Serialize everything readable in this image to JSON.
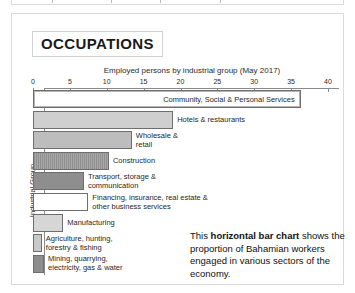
{
  "panel": {
    "title": "OCCUPATIONS"
  },
  "chart_data": {
    "type": "bar",
    "orientation": "horizontal",
    "title": "Employed persons by industrial group (May 2017)",
    "xlabel": "",
    "ylabel": "Industrial Group",
    "xlim": [
      0,
      40
    ],
    "ticks": [
      "0",
      "5",
      "10",
      "15",
      "20",
      "25",
      "30",
      "35",
      "40"
    ],
    "tick_values": [
      0,
      5,
      10,
      15,
      20,
      25,
      30,
      35,
      40
    ],
    "grid": false,
    "legend": "none",
    "categories": [
      "Community, Social & Personal Services",
      "Hotels & restaurants",
      "Wholesale & retail",
      "Construction",
      "Transport, storage & communication",
      "Financing, insurance, real estate & other business services",
      "Manufacturing",
      "Agriculture, hunting, forestry & fishing",
      "Mining, quarrying, electricity, gas & water"
    ],
    "values": [
      36.3,
      19.0,
      13.4,
      10.3,
      6.9,
      7.5,
      4.1,
      1.2,
      1.5
    ],
    "bars": [
      {
        "label": "Community, Social & Personal Services",
        "value": 36.3,
        "fill": "#ffffff",
        "pattern": "solid",
        "label_boxed": true
      },
      {
        "label": "Hotels & restaurants",
        "value": 19.0,
        "fill": "#cfcfcf",
        "pattern": "solid",
        "label_boxed": false
      },
      {
        "label": "Wholesale &\nretail",
        "value": 13.4,
        "fill": "#bdbdbd",
        "pattern": "solid",
        "label_boxed": false
      },
      {
        "label": "Construction",
        "value": 10.3,
        "fill": "#a0a0a0",
        "pattern": "hatch",
        "label_boxed": false
      },
      {
        "label": "Transport, storage &\ncommunication",
        "value": 6.9,
        "fill": "#8e8e8e",
        "pattern": "solid",
        "label_boxed": false
      },
      {
        "label": "Financing, insurance, real estate &\nother business services",
        "value": 7.5,
        "fill": "#ffffff",
        "pattern": "solid",
        "label_boxed": false
      },
      {
        "label": "Manufacturing",
        "value": 4.1,
        "fill": "#d6d6d6",
        "pattern": "solid",
        "label_boxed": false
      },
      {
        "label": "Agriculture, hunting,\nforestry & fishing",
        "value": 1.2,
        "fill": "#c9c9c9",
        "pattern": "solid",
        "label_boxed": false
      },
      {
        "label": "Mining, quarrying,\nelectricity, gas & water",
        "value": 1.5,
        "fill": "#8e8e8e",
        "pattern": "solid",
        "label_boxed": false
      }
    ]
  },
  "annotation": {
    "lead": "This ",
    "bold": "horizontal bar chart",
    "rest": " shows the proportion of Bahamian workers engaged in various sectors of the economy."
  }
}
